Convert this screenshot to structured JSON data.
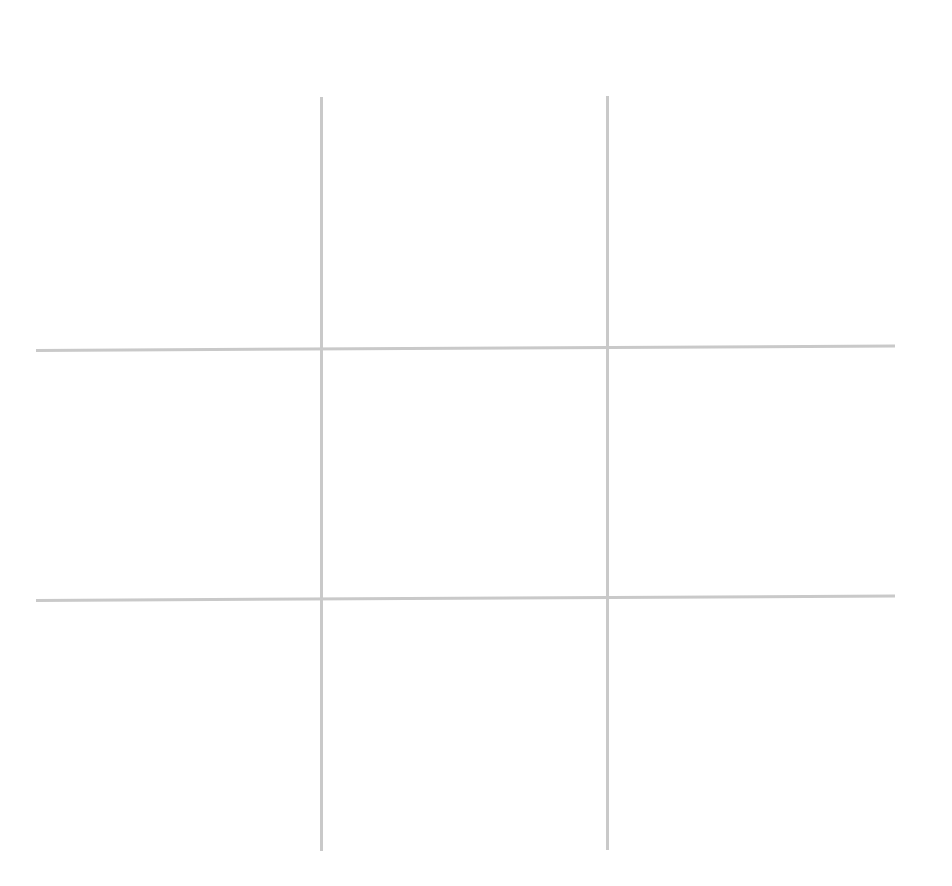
{
  "game": {
    "type": "tic-tac-toe",
    "line_color": "#c9c9c9",
    "background": "#ffffff",
    "cells": [
      [
        "",
        "",
        ""
      ],
      [
        "",
        "",
        ""
      ],
      [
        "",
        "",
        ""
      ]
    ]
  }
}
